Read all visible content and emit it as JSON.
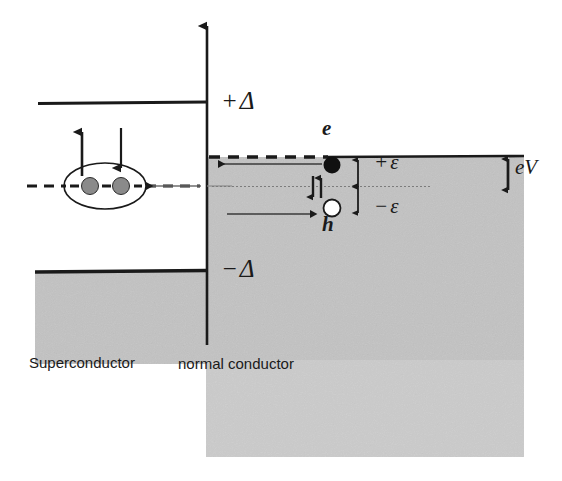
{
  "figure": {
    "type": "energy-level-diagram",
    "colors": {
      "shading": "#c9c9c9",
      "shading_light": "#d6d6d6",
      "line": "#1a1a1a",
      "electron_fill": "#111111",
      "hole_fill": "#ffffff",
      "cooper_pair_fill": "#8a8a8a"
    }
  },
  "labels": {
    "delta_positive": "+Δ",
    "delta_negative": "−Δ",
    "epsilon_positive": "+ε",
    "epsilon_negative": "−ε",
    "electron": "e",
    "hole": "h",
    "bias": "eV",
    "superconductor": "Superconductor",
    "normal_conductor": "normal conductor"
  },
  "axis": {
    "name": "energy-axis",
    "orientation": "vertical",
    "arrow_head": "up",
    "x": 207,
    "top": 22,
    "bottom": 345
  },
  "regions": [
    {
      "name": "superconductor-condensate",
      "side": "left",
      "x": 35,
      "y": 272,
      "width": 172,
      "height": 92,
      "fill": "#c9c9c9"
    },
    {
      "name": "normal-conductor-fermi-sea",
      "side": "right",
      "x": 206,
      "y": 157,
      "width": 318,
      "height": 300,
      "fill": "#c9c9c9"
    }
  ],
  "lines": [
    {
      "name": "gap-edge-upper",
      "label": "+Δ",
      "style": "solid",
      "x1": 38,
      "y1": 103,
      "x2": 207,
      "y2": 103
    },
    {
      "name": "gap-edge-lower",
      "label": "−Δ",
      "style": "solid",
      "x1": 35,
      "y1": 271,
      "x2": 207,
      "y2": 271
    },
    {
      "name": "fermi-level-superconductor",
      "style": "dashed",
      "x1": 28,
      "y1": 186,
      "x2": 200,
      "y2": 186
    },
    {
      "name": "fermi-level-normal-dashed",
      "style": "dashed",
      "x1": 210,
      "y1": 157,
      "x2": 330,
      "y2": 157
    },
    {
      "name": "fermi-level-normal-solid",
      "style": "solid",
      "x1": 330,
      "y1": 157,
      "x2": 524,
      "y2": 157
    },
    {
      "name": "chemical-potential-normal",
      "style": "dotted",
      "x1": 212,
      "y1": 186,
      "x2": 430,
      "y2": 186
    }
  ],
  "particles": [
    {
      "name": "electron",
      "kind": "filled-circle",
      "cx": 332,
      "cy": 165,
      "r": 8,
      "fill": "#111111",
      "label": "e"
    },
    {
      "name": "hole",
      "kind": "open-circle",
      "cx": 332,
      "cy": 208,
      "r": 8,
      "fill": "#ffffff",
      "label": "h"
    },
    {
      "name": "cooper-pair-electron-1",
      "kind": "shaded-circle",
      "cx": 90,
      "cy": 186,
      "r": 8,
      "fill": "#8a8a8a"
    },
    {
      "name": "cooper-pair-electron-2",
      "kind": "shaded-circle",
      "cx": 121,
      "cy": 186,
      "r": 8,
      "fill": "#8a8a8a"
    }
  ],
  "cooper_pair": {
    "name": "cooper-pair-ellipse",
    "cx": 105,
    "cy": 186,
    "rx": 41,
    "ry": 23
  },
  "arrows": [
    {
      "name": "spin-up-arrow-pair",
      "direction": "up",
      "x": 82,
      "y1": 175,
      "y2": 128
    },
    {
      "name": "spin-down-arrow-pair",
      "direction": "down",
      "x": 121,
      "y1": 128,
      "y2": 172
    },
    {
      "name": "andreev-pair-transfer-arrow",
      "direction": "left",
      "x1": 200,
      "y": 186,
      "x2": 143
    },
    {
      "name": "electron-incoming-arrow",
      "direction": "left",
      "x1": 320,
      "y": 164,
      "x2": 216
    },
    {
      "name": "hole-retro-reflected-arrow",
      "direction": "right",
      "x1": 228,
      "y": 214,
      "x2": 308
    },
    {
      "name": "spin-up-small-arrow",
      "direction": "up",
      "x": 320,
      "y1": 197,
      "y2": 175
    },
    {
      "name": "spin-down-small-arrow",
      "direction": "down",
      "x": 313,
      "y1": 175,
      "y2": 200
    },
    {
      "name": "energy-epsilon-above-arrow",
      "direction": "double-vertical",
      "x": 358,
      "y1": 157,
      "y2": 188
    },
    {
      "name": "energy-epsilon-below-arrow",
      "direction": "double-vertical",
      "x": 358,
      "y1": 186,
      "y2": 215
    },
    {
      "name": "bias-voltage-arrow",
      "direction": "double-vertical",
      "x": 508,
      "y1": 157,
      "y2": 190
    }
  ]
}
